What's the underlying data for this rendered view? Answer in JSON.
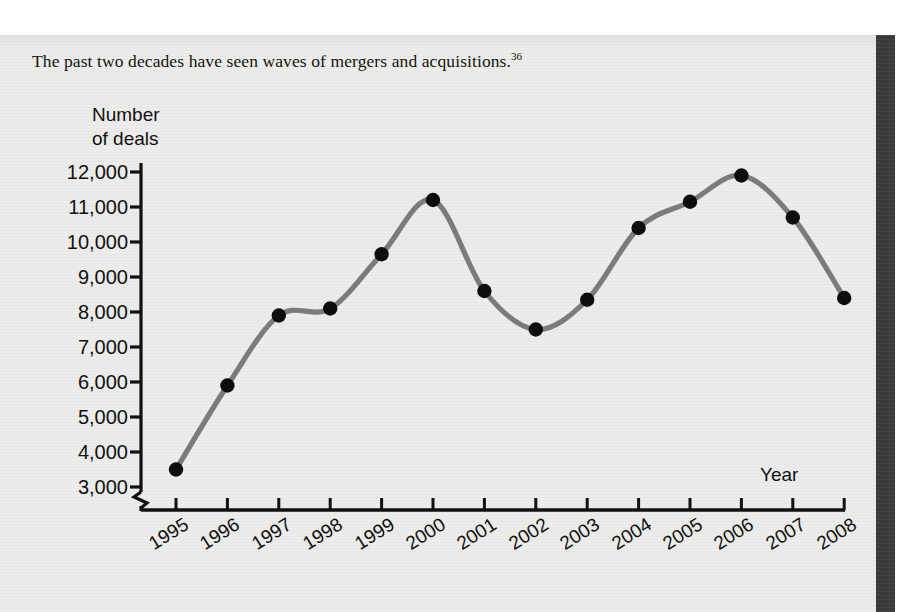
{
  "page": {
    "caption": "The past two decades have seen waves of mergers and acquisitions.",
    "note_ref": "36",
    "ghost_top_line": "l        l                  g                    g"
  },
  "colors": {
    "paper": "#ececeb",
    "ink": "#111111",
    "line": "#7b7b7b",
    "marker": "#0d0d0d",
    "gutter": "#3a3a3a"
  },
  "chart_data": {
    "type": "line",
    "title": "",
    "xlabel": "Year",
    "ylabel": "Number of deals",
    "ylabel_line1": "Number",
    "ylabel_line2": "of deals",
    "categories": [
      "1995",
      "1996",
      "1997",
      "1998",
      "1999",
      "2000",
      "2001",
      "2002",
      "2003",
      "2004",
      "2005",
      "2006",
      "2007",
      "2008"
    ],
    "values": [
      3500,
      5900,
      7900,
      8100,
      9650,
      11200,
      8600,
      7500,
      8350,
      10400,
      11150,
      11900,
      10700,
      8400
    ],
    "series": [
      {
        "name": "Number of deals",
        "values": [
          3500,
          5900,
          7900,
          8100,
          9650,
          11200,
          8600,
          7500,
          8350,
          10400,
          11150,
          11900,
          10700,
          8400
        ]
      }
    ],
    "ylim": [
      2650,
      12400
    ],
    "yticks": [
      3000,
      4000,
      5000,
      6000,
      7000,
      8000,
      9000,
      10000,
      11000,
      12000
    ],
    "ytick_labels": [
      "3,000",
      "4,000",
      "5,000",
      "6,000",
      "7,000",
      "8,000",
      "9,000",
      "10,000",
      "11,000",
      "12,000"
    ],
    "grid": false,
    "legend": false,
    "legend_position": "none",
    "axis_break": true,
    "marker": "filled-circle",
    "line_color": "#7b7b7b",
    "marker_color": "#0d0d0d",
    "annotations": []
  }
}
